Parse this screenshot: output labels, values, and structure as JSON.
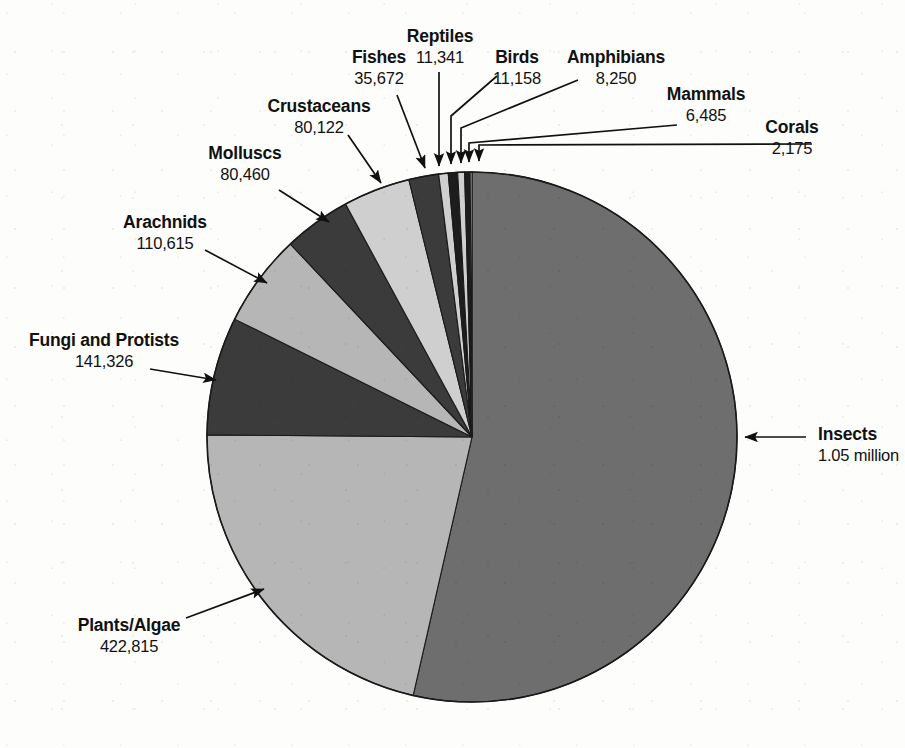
{
  "figure": {
    "background": "#fdfdfb",
    "outline_color": "#1a1a1a",
    "width": 905,
    "height": 748
  },
  "palette": {
    "mid_gray": "#6e6e6e",
    "light_gray": "#b6b6b6",
    "dark_gray": "#3b3b3b",
    "near_black": "#1d1d1d",
    "pale_gray": "#cfcfcf"
  },
  "chart_data": {
    "type": "pie",
    "title": "",
    "subtitle": "",
    "xlabel": "",
    "ylabel": "",
    "grid": false,
    "legend": "none",
    "units": "described species",
    "total": 1960419,
    "start_angle_deg": 0,
    "direction": "clockwise-from-top",
    "categories": [
      "Insects",
      "Plants/Algae",
      "Fungi and Protists",
      "Arachnids",
      "Molluscs",
      "Crustaceans",
      "Fishes",
      "Reptiles",
      "Birds",
      "Amphibians",
      "Mammals",
      "Corals"
    ],
    "values": [
      1050000,
      422815,
      141326,
      110615,
      80460,
      80122,
      35672,
      11341,
      11158,
      8250,
      6485,
      2175
    ],
    "value_labels": [
      "1.05 million",
      "422,815",
      "141,326",
      "110,615",
      "80,460",
      "80,122",
      "35,672",
      "11,341",
      "11,158",
      "8,250",
      "6,485",
      "2,175"
    ],
    "slice_colors": [
      "#6e6e6e",
      "#b6b6b6",
      "#3b3b3b",
      "#b6b6b6",
      "#3b3b3b",
      "#cfcfcf",
      "#3b3b3b",
      "#cfcfcf",
      "#1d1d1d",
      "#cfcfcf",
      "#1d1d1d",
      "#cfcfcf"
    ]
  },
  "labels": [
    {
      "name": "Insects",
      "value": "1.05 million",
      "align": "left"
    },
    {
      "name": "Plants/Algae",
      "value": "422,815",
      "align": "center"
    },
    {
      "name": "Fungi and Protists",
      "value": "141,326",
      "align": "center"
    },
    {
      "name": "Arachnids",
      "value": "110,615",
      "align": "center"
    },
    {
      "name": "Molluscs",
      "value": "80,460",
      "align": "center"
    },
    {
      "name": "Crustaceans",
      "value": "80,122",
      "align": "center"
    },
    {
      "name": "Fishes",
      "value": "35,672",
      "align": "center"
    },
    {
      "name": "Reptiles",
      "value": "11,341",
      "align": "center"
    },
    {
      "name": "Birds",
      "value": "11,158",
      "align": "center"
    },
    {
      "name": "Amphibians",
      "value": "8,250",
      "align": "center"
    },
    {
      "name": "Mammals",
      "value": "6,485",
      "align": "center"
    },
    {
      "name": "Corals",
      "value": "2,175",
      "align": "center"
    }
  ]
}
